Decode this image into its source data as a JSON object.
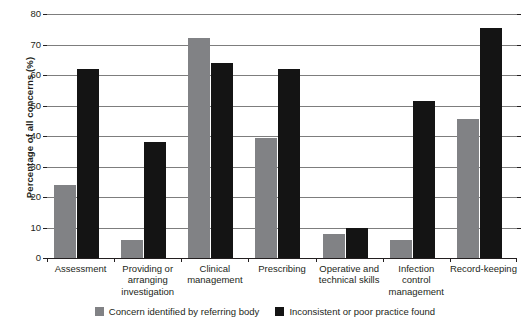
{
  "chart_data": {
    "type": "bar",
    "title": "",
    "xlabel": "",
    "ylabel": "Percentage of all concerns (%)",
    "ylim": [
      0,
      80
    ],
    "ytick_step": 10,
    "yticks": [
      "80",
      "70",
      "60",
      "50",
      "40",
      "30",
      "20",
      "10",
      "0"
    ],
    "grid": true,
    "legend_position": "bottom",
    "categories": [
      "Assessment",
      "Providing or\narranging\ninvestigation",
      "Clinical\nmanagement",
      "Prescribing",
      "Operative and\ntechnical skills",
      "Infection\ncontrol\nmanagement",
      "Record-keeping"
    ],
    "series": [
      {
        "name": "Concern identified by referring body",
        "color": "#818285",
        "values": [
          24,
          6,
          72,
          39.5,
          8,
          6,
          45.5
        ]
      },
      {
        "name": "Inconsistent or poor practice found",
        "color": "#141414",
        "values": [
          62,
          38,
          64,
          62,
          10,
          51.5,
          75.5
        ]
      }
    ]
  },
  "colors": {
    "series_gray": "#818285",
    "series_black": "#141414",
    "gridline": "#7d7d7d",
    "axis": "#231f20",
    "background": "#ffffff"
  }
}
